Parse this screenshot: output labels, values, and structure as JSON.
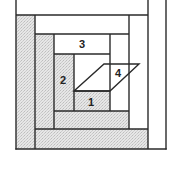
{
  "diagram": {
    "colors": {
      "line": "#2a2a2a",
      "shaded": "#d9d9d9",
      "white": "#ffffff"
    },
    "labels": {
      "piece_1": "1",
      "piece_2": "2",
      "piece_3": "3",
      "piece_4": "4"
    }
  }
}
